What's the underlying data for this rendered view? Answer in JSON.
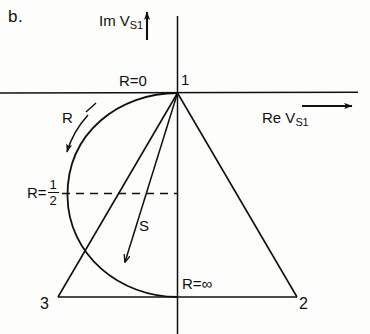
{
  "figure": {
    "panel_letter": "b.",
    "axes": {
      "y_axis_label_prefix": "Im",
      "y_axis_label_var": "V",
      "y_axis_label_sub": "S1",
      "y_axis_arrow": "up-arrow-icon",
      "x_axis_label_prefix": "Re",
      "x_axis_label_var": "V",
      "x_axis_label_sub": "S1",
      "x_axis_arrow": "right-arrow-icon"
    },
    "annotations": {
      "r_zero": "R=0",
      "vertex_one": "1",
      "r_parameter": "R",
      "r_half_prefix": "R=",
      "r_half_numerator": "1",
      "r_half_denominator": "2",
      "s_parameter": "S",
      "r_infinity": "R=∞",
      "vertex_three": "3",
      "vertex_two": "2"
    },
    "colors": {
      "ink": "#101010",
      "background": "#fdfdfc"
    }
  }
}
